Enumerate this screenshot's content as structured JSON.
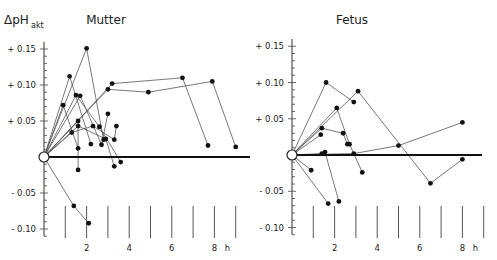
{
  "chart_data": [
    {
      "type": "line",
      "title": "Mutter",
      "ylabel": "ΔpH akt",
      "xlabel": "h",
      "xlim": [
        0,
        9
      ],
      "ylim": [
        -0.11,
        0.16
      ],
      "x_ticks": [
        2,
        4,
        6,
        8
      ],
      "y_ticks": [
        0.15,
        0.1,
        0.05,
        -0.05,
        -0.1
      ],
      "y_tick_labels": [
        "+ 0.15",
        "+ 0.10",
        "+ 0.05",
        "- 0.05",
        "- 0.10"
      ],
      "origin": [
        0,
        0
      ],
      "series": [
        {
          "name": "1",
          "points": [
            [
              0,
              0
            ],
            [
              2.0,
              0.151
            ],
            [
              2.8,
              0.024
            ]
          ]
        },
        {
          "name": "2",
          "points": [
            [
              0,
              0
            ],
            [
              1.2,
              0.112
            ],
            [
              2.2,
              0.018
            ]
          ]
        },
        {
          "name": "3",
          "points": [
            [
              0,
              0
            ],
            [
              0.9,
              0.072
            ],
            [
              1.6,
              0.012
            ]
          ]
        },
        {
          "name": "4",
          "points": [
            [
              0,
              0
            ],
            [
              1.5,
              0.086
            ],
            [
              2.6,
              0.042
            ],
            [
              3.6,
              -0.007
            ]
          ]
        },
        {
          "name": "5",
          "points": [
            [
              0,
              0
            ],
            [
              1.7,
              0.085
            ],
            [
              2.7,
              0.017
            ],
            [
              3.0,
              0.06
            ]
          ]
        },
        {
          "name": "6",
          "points": [
            [
              0,
              0
            ],
            [
              1.6,
              0.05
            ],
            [
              1.6,
              -0.018
            ]
          ]
        },
        {
          "name": "7",
          "points": [
            [
              0,
              0
            ],
            [
              1.6,
              0.043
            ],
            [
              2.9,
              0.025
            ],
            [
              3.3,
              -0.013
            ]
          ]
        },
        {
          "name": "8",
          "points": [
            [
              0,
              0
            ],
            [
              1.3,
              0.034
            ],
            [
              2.3,
              0.043
            ],
            [
              3.3,
              0.024
            ],
            [
              3.4,
              0.043
            ]
          ]
        },
        {
          "name": "9",
          "points": [
            [
              0,
              0
            ],
            [
              3.0,
              0.094
            ],
            [
              4.9,
              0.09
            ],
            [
              7.9,
              0.105
            ],
            [
              9.0,
              0.014
            ]
          ]
        },
        {
          "name": "10",
          "points": [
            [
              0,
              0
            ],
            [
              3.2,
              0.102
            ],
            [
              6.5,
              0.11
            ],
            [
              7.7,
              0.016
            ]
          ]
        },
        {
          "name": "11",
          "points": [
            [
              0,
              0
            ],
            [
              1.4,
              -0.068
            ],
            [
              2.1,
              -0.092
            ]
          ]
        }
      ]
    },
    {
      "type": "line",
      "title": "Fetus",
      "ylabel": "ΔpH akt",
      "xlabel": "h",
      "xlim": [
        0,
        9
      ],
      "ylim": [
        -0.11,
        0.16
      ],
      "x_ticks": [
        2,
        4,
        6,
        8
      ],
      "y_ticks": [
        0.15,
        0.1,
        0.05,
        -0.05,
        -0.1
      ],
      "y_tick_labels": [
        "+ 0.15",
        "+ 0.10",
        "+ 0.05",
        "- 0.05",
        "- 0.10"
      ],
      "origin": [
        0,
        0
      ],
      "series": [
        {
          "name": "1",
          "points": [
            [
              0,
              0
            ],
            [
              1.6,
              0.1
            ],
            [
              2.9,
              0.073
            ]
          ]
        },
        {
          "name": "2",
          "points": [
            [
              0,
              0
            ],
            [
              3.1,
              0.088
            ],
            [
              6.5,
              -0.039
            ],
            [
              8.0,
              -0.006
            ]
          ]
        },
        {
          "name": "3",
          "points": [
            [
              0,
              0
            ],
            [
              2.1,
              0.065
            ],
            [
              2.7,
              0.015
            ],
            [
              3.3,
              -0.024
            ]
          ]
        },
        {
          "name": "4",
          "points": [
            [
              0,
              0
            ],
            [
              1.4,
              0.037
            ],
            [
              2.4,
              0.03
            ],
            [
              2.6,
              0.015
            ]
          ]
        },
        {
          "name": "5",
          "points": [
            [
              0,
              0
            ],
            [
              1.35,
              0.028
            ]
          ]
        },
        {
          "name": "6",
          "points": [
            [
              0,
              0
            ],
            [
              1.4,
              0.002
            ],
            [
              1.55,
              0.004
            ],
            [
              2.2,
              -0.064
            ]
          ]
        },
        {
          "name": "7",
          "points": [
            [
              0,
              0
            ],
            [
              2.9,
              0.002
            ],
            [
              5.0,
              0.013
            ],
            [
              8.0,
              0.045
            ]
          ]
        },
        {
          "name": "8",
          "points": [
            [
              0,
              0
            ],
            [
              0.9,
              -0.021
            ]
          ]
        },
        {
          "name": "9",
          "points": [
            [
              0,
              0
            ],
            [
              1.7,
              -0.067
            ]
          ]
        }
      ]
    }
  ],
  "panels": [
    {
      "title": "Mutter",
      "ylabel_main": "ΔpH",
      "ylabel_sub": "akt",
      "xunit": "h"
    },
    {
      "title": "Fetus",
      "xunit": "h"
    }
  ]
}
